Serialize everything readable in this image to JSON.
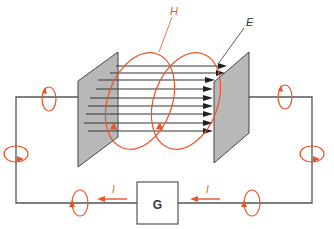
{
  "diagram": {
    "labels": {
      "h_field": "H",
      "e_field": "E",
      "generator": "G",
      "current_left": "I",
      "current_right": "I"
    },
    "colors": {
      "wire": "#555555",
      "plate_fill": "#b8b8b8",
      "plate_stroke": "#444444",
      "field_line": "#333333",
      "magnetic": "#e8552a",
      "label": "#333333"
    },
    "elements": {
      "plates": [
        "left-plate",
        "right-plate"
      ],
      "e_field_lines": 9,
      "h_loops_between_plates": 2,
      "wire_h_loops": 6,
      "current_arrows": 2
    }
  }
}
